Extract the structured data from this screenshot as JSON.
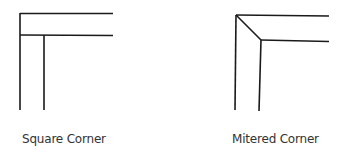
{
  "diagrams": [
    {
      "id": "square",
      "label": "Square Corner"
    },
    {
      "id": "mitered",
      "label": "Mitered Corner"
    }
  ],
  "colors": {
    "line": "#1a1a1a",
    "text": "#333333",
    "background": "#ffffff"
  }
}
